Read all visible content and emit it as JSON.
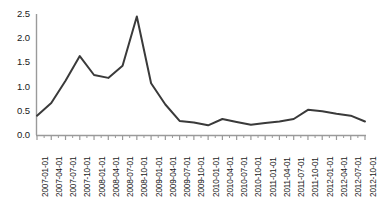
{
  "chart_data": {
    "type": "line",
    "title": "",
    "subtitle": "",
    "xlabel": "",
    "ylabel": "",
    "ylim": [
      0.0,
      2.5
    ],
    "ytick_labels": [
      "0.0",
      "0.5",
      "1.0",
      "1.5",
      "2.0",
      "2.5"
    ],
    "ytick_values": [
      0.0,
      0.5,
      1.0,
      1.5,
      2.0,
      2.5
    ],
    "grid": false,
    "legend": null,
    "legend_position": "none",
    "line_color": "#3a3a3a",
    "axis_color": "#9a9a9a",
    "categories": [
      "2007-01-01",
      "2007-04-01",
      "2007-07-01",
      "2007-10-01",
      "2008-01-01",
      "2008-04-01",
      "2008-07-01",
      "2008-10-01",
      "2009-01-01",
      "2009-04-01",
      "2009-07-01",
      "2009-10-01",
      "2010-01-01",
      "2010-04-01",
      "2010-07-01",
      "2010-10-01",
      "2011-01-01",
      "2011-04-01",
      "2011-07-01",
      "2011-10-01",
      "2012-01-01",
      "2012-04-01",
      "2012-07-01",
      "2012-10-01"
    ],
    "values": [
      0.4,
      0.66,
      1.12,
      1.63,
      1.24,
      1.18,
      1.43,
      2.45,
      1.07,
      0.63,
      0.29,
      0.26,
      0.2,
      0.33,
      0.27,
      0.21,
      0.25,
      0.28,
      0.33,
      0.52,
      0.49,
      0.44,
      0.4,
      0.28
    ]
  }
}
